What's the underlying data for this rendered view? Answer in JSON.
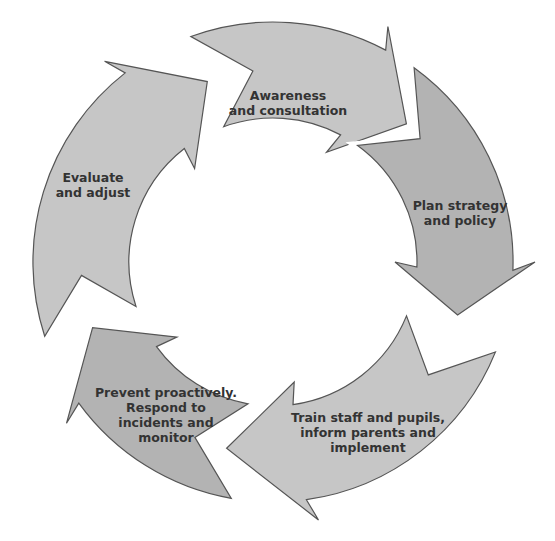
{
  "diagram": {
    "type": "cycle",
    "direction": "clockwise",
    "center": [
      273,
      262
    ],
    "outer_radius": 240,
    "inner_radius": 144,
    "colors": {
      "fill": "#c6c6c6",
      "fill_dark": "#b3b3b3",
      "stroke": "#555555",
      "text": "#333333",
      "gap": "#ffffff"
    },
    "steps": [
      {
        "id": "awareness",
        "label": "Awareness\nand consultation",
        "tail": -20,
        "head_base": 28,
        "tip": 44,
        "label_pos": [
          288,
          103
        ]
      },
      {
        "id": "plan",
        "label": "Plan strategy\nand policy",
        "tail": 36,
        "head_base": 92,
        "tip": 106,
        "label_pos": [
          460,
          213
        ]
      },
      {
        "id": "train",
        "label": "Train staff and pupils,\ninform parents and\nimplement",
        "tail": 112,
        "head_base": 172,
        "tip": 194,
        "label_pos": [
          368,
          432
        ]
      },
      {
        "id": "prevent",
        "label": "Prevent proactively.\nRespond to\nincidents and\nmonitor",
        "tail": 190,
        "head_base": 234,
        "tip": 250,
        "label_pos": [
          166,
          415
        ]
      },
      {
        "id": "evaluate",
        "label": "Evaluate\nand adjust",
        "tail": 252,
        "head_base": 322,
        "tip": 340,
        "label_pos": [
          93,
          185
        ]
      }
    ]
  }
}
